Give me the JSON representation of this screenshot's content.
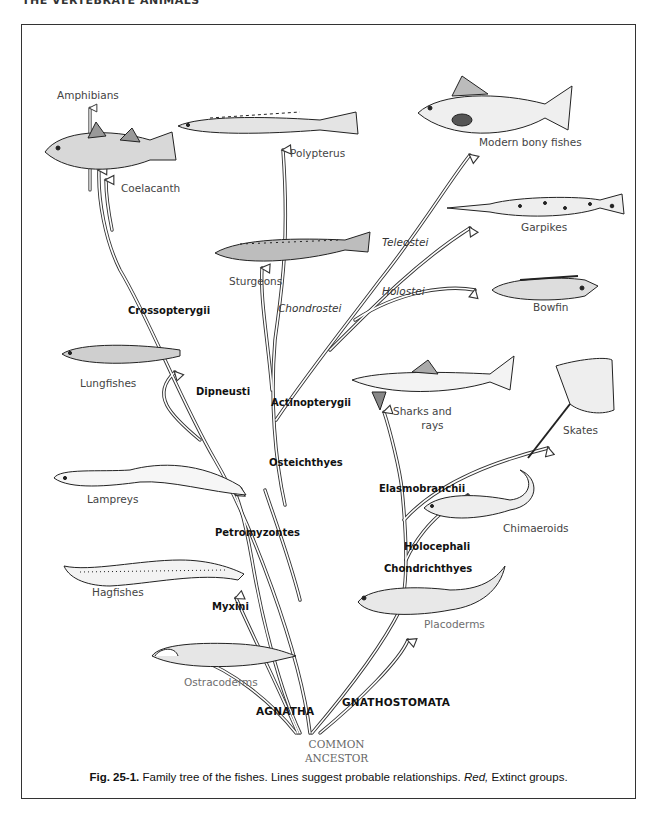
{
  "page": {
    "running_head": "THE VERTEBRATE ANIMALS"
  },
  "figure": {
    "number": "Fig. 25-1.",
    "caption_text": " Family tree of the fishes. Lines suggest probable relationships. ",
    "caption_red": "Red,",
    "caption_tail": " Extinct groups."
  },
  "root": {
    "line1": "COMMON",
    "line2": "ANCESTOR"
  },
  "major_groups": {
    "agnatha": "AGNATHA",
    "gnathostomata": "GNATHOSTOMATA"
  },
  "taxa": {
    "petromyzontes": "Petromyzontes",
    "myxini": "Myxini",
    "osteichthyes": "Osteichthyes",
    "actinopterygii": "Actinopterygii",
    "dipneusti": "Dipneusti",
    "crossopterygii": "Crossopterygii",
    "chondrostei": "Chondrostei",
    "holostei": "Holostei",
    "teleostei": "Teleostei",
    "chondrichthyes": "Chondrichthyes",
    "holocephali": "Holocephali",
    "elasmobranchii": "Elasmobranchii"
  },
  "organisms": {
    "amphibians": "Amphibians",
    "coelacanth": "Coelacanth",
    "polypterus": "Polypterus",
    "modern_bony_fishes": "Modern bony fishes",
    "garpikes": "Garpikes",
    "sturgeons": "Sturgeons",
    "bowfin": "Bowfin",
    "lungfishes": "Lungfishes",
    "sharks_and_rays_1": "Sharks and",
    "sharks_and_rays_2": "rays",
    "skates": "Skates",
    "lampreys": "Lampreys",
    "chimaeroids": "Chimaeroids",
    "hagfishes": "Hagfishes",
    "placoderms": "Placoderms",
    "ostracoderms": "Ostracoderms"
  },
  "legend": {
    "extinct_color": "#6e6e6e",
    "living_color": "#1a1a1a",
    "extinct_groups": [
      "Ostracoderms",
      "Placoderms"
    ]
  }
}
